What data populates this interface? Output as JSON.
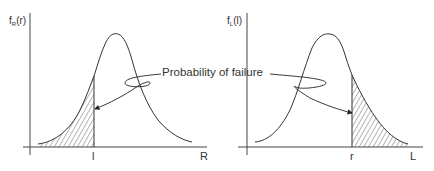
{
  "diagram": {
    "callout_label": "Probability of failure",
    "panels": [
      {
        "id": "resistance",
        "y_axis_label_main": "f",
        "y_axis_label_sub": "R",
        "y_axis_label_arg": "(r)",
        "x_axis_label": "R",
        "cutoff_label": "l",
        "shaded_region": "left tail (R < l)"
      },
      {
        "id": "load",
        "y_axis_label_main": "f",
        "y_axis_label_sub": "L",
        "y_axis_label_arg": "(l)",
        "x_axis_label": "L",
        "cutoff_label": "r",
        "shaded_region": "right tail (L > r)"
      }
    ],
    "colors": {
      "stroke": "#333333",
      "background": "#ffffff"
    }
  }
}
